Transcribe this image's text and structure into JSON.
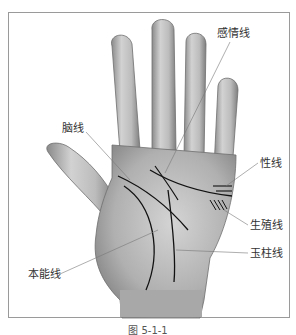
{
  "figure": {
    "caption": "图 5-1-1",
    "labels": {
      "heart_line": "感情线",
      "head_line": "脑线",
      "sex_line": "性线",
      "reproduction_line": "生殖线",
      "fate_line": "玉柱线",
      "life_line": "本能线"
    }
  }
}
